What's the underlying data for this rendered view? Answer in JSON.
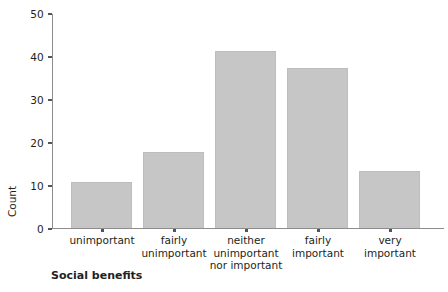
{
  "chart_data": {
    "type": "bar",
    "title": "",
    "subtitle": "",
    "xlabel": "Social benefits",
    "ylabel": "Count",
    "categories": [
      "unimportant",
      "fairly unimportant",
      "neither unimportant nor important",
      "fairly important",
      "very important"
    ],
    "category_lines": [
      [
        "unimportant"
      ],
      [
        "fairly",
        "unimportant"
      ],
      [
        "neither",
        "unimportant",
        "nor important"
      ],
      [
        "fairly",
        "important"
      ],
      [
        "very",
        "important"
      ]
    ],
    "values": [
      11,
      18,
      41.5,
      37.5,
      13.5
    ],
    "ylim": [
      0,
      50
    ],
    "yticks": [
      0,
      10,
      20,
      30,
      40,
      50
    ],
    "ytick_labels": [
      "0",
      "10",
      "20",
      "30",
      "40",
      "50"
    ],
    "grid": false,
    "legend": false,
    "legend_position": "none",
    "bar_color": "#c6c6c6",
    "axis_color": "#8d8d8d",
    "text_color": "#231f20"
  }
}
